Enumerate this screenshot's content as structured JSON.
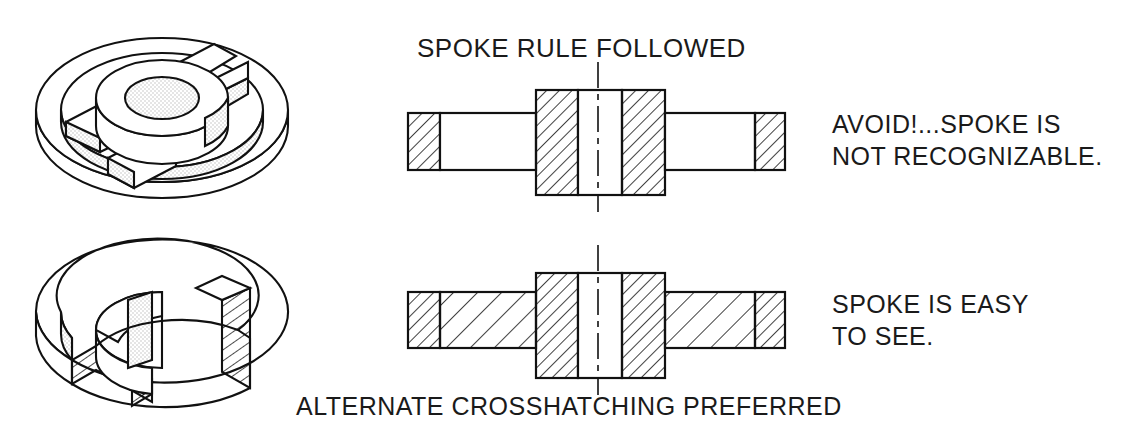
{
  "document": {
    "kind": "engineering-drawing",
    "subject": "Spoke crosshatching convention in sectional views",
    "background_color": "#ffffff",
    "line_color": "#111111",
    "shade_color": "#d8d8d8"
  },
  "labels": {
    "title": "SPOKE RULE FOLLOWED",
    "avoid_line1": "AVOID!...SPOKE IS",
    "avoid_line2": "NOT RECOGNIZABLE.",
    "good_line1": "SPOKE IS EASY",
    "good_line2": "TO SEE.",
    "bottom_caption": "ALTERNATE CROSSHATCHING PREFERRED"
  },
  "figures": {
    "pictorial_top": {
      "name": "spoked-wheel-pictorial",
      "description": "Isometric view of a four-spoke wheel with central hub and bore"
    },
    "pictorial_bottom": {
      "name": "spoked-wheel-cutaway-pictorial",
      "description": "Isometric cutaway of the same wheel showing crosshatched cut faces"
    },
    "section_top": {
      "name": "section-view-spoke-hatched",
      "description": "Full section with spoke crosshatched - incorrect practice",
      "parts": [
        "left-rim",
        "spoke-web",
        "hub",
        "bore",
        "right-rim",
        "centerline"
      ]
    },
    "section_bottom": {
      "name": "section-view-spoke-alternate-hatched",
      "description": "Section with alternate wider crosshatching through the spoke - preferred",
      "parts": [
        "left-rim",
        "spoke-web",
        "hub",
        "bore",
        "right-rim",
        "centerline"
      ]
    }
  }
}
